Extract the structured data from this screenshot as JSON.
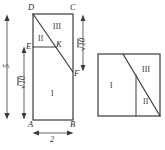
{
  "figure": {
    "type": "geometry-dissection-diagram",
    "stroke_color": "#3a3a3a",
    "background_color": "#ffffff",
    "left_figure": {
      "name": "rectangle-ABCD",
      "vertices": [
        {
          "id": "A",
          "label": "A",
          "x": 0,
          "y": 0
        },
        {
          "id": "B",
          "label": "B",
          "x": 2,
          "y": 0
        },
        {
          "id": "C",
          "label": "C",
          "x": 2,
          "y": 5
        },
        {
          "id": "D",
          "label": "D",
          "x": 0,
          "y": 5
        },
        {
          "id": "E",
          "label": "E",
          "x": 0,
          "y": 3.162
        },
        {
          "id": "F",
          "label": "F",
          "x": 2,
          "y": 1.838
        },
        {
          "id": "K",
          "label": "K",
          "x": 1.265,
          "y": 3.162
        }
      ],
      "segments": [
        {
          "from": "D",
          "to": "F",
          "kind": "diagonal-cut"
        },
        {
          "from": "E",
          "to": "K",
          "kind": "horizontal-cut"
        }
      ],
      "regions": [
        {
          "id": "I",
          "label": "I"
        },
        {
          "id": "II",
          "label": "II"
        },
        {
          "id": "III",
          "label": "III"
        }
      ],
      "dimensions": [
        {
          "id": "height-total",
          "label": "5",
          "value": "5",
          "orientation": "vertical",
          "side": "left-outer"
        },
        {
          "id": "height-AE",
          "label": "√10",
          "radicand": "10",
          "orientation": "vertical",
          "side": "left-inner"
        },
        {
          "id": "height-CF",
          "label": "√10",
          "radicand": "10",
          "orientation": "vertical",
          "side": "right"
        },
        {
          "id": "width-AB",
          "label": "2",
          "value": "2",
          "orientation": "horizontal",
          "side": "bottom"
        }
      ]
    },
    "right_figure": {
      "name": "square-assembled",
      "side_label": "√10",
      "regions": [
        {
          "id": "I",
          "label": "I"
        },
        {
          "id": "II",
          "label": "II"
        },
        {
          "id": "III",
          "label": "III"
        }
      ],
      "segments": [
        {
          "id": "diagonal-cut",
          "kind": "diagonal-cut"
        },
        {
          "id": "vertical-cut",
          "kind": "vertical-cut"
        }
      ]
    }
  }
}
